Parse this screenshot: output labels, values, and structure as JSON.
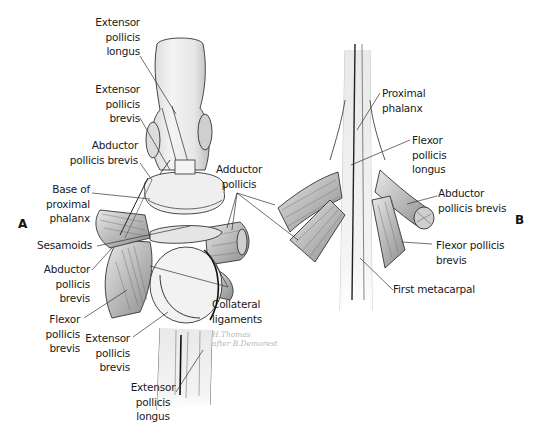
{
  "figure": {
    "panels": [
      {
        "id": "A",
        "letter": "A",
        "labels": {
          "epl_top": "Extensor\npollicis\nlongus",
          "epb_top": "Extensor\npollicis\nbrevis",
          "apb_top": "Abductor\npollicis brevis",
          "base_prox_phalanx": "Base of\nproximal\nphalanx",
          "sesamoids": "Sesamoids",
          "apb_bottom": "Abductor\npollicis\nbrevis",
          "fpb": "Flexor\npollicis\nbrevis",
          "epb_bottom": "Extensor\npollicis\nbrevis",
          "epl_bottom": "Extensor\npollicis\nlongus",
          "collateral": "Collateral\nligaments"
        }
      },
      {
        "id": "B",
        "letter": "B",
        "labels": {
          "prox_phalanx": "Proximal\nphalanx",
          "fpl": "Flexor\npollicis\nlongus",
          "apb": "Abductor\npollicis brevis",
          "fpb": "Flexor pollicis\nbrevis",
          "first_metacarpal": "First metacarpal"
        }
      }
    ],
    "shared_labels": {
      "adductor": "Adductor\npollicis"
    },
    "signature": "H.Thomas\nafter B.Demorest"
  }
}
